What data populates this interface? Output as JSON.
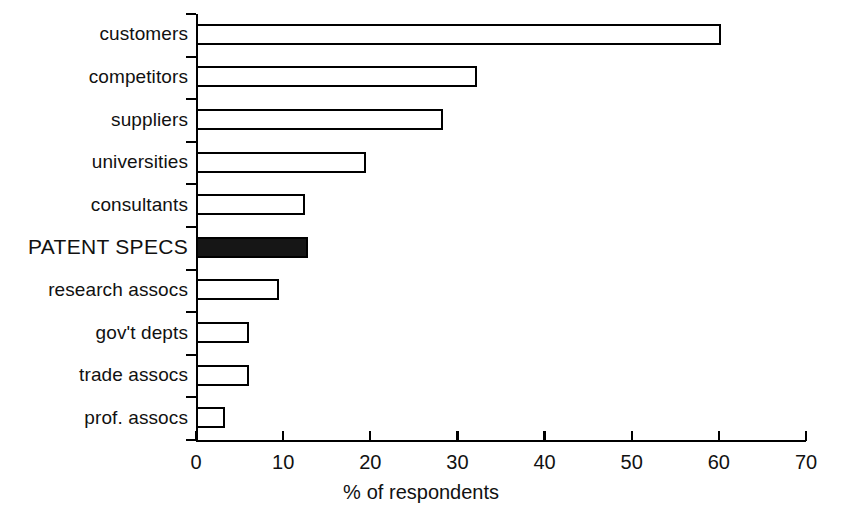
{
  "chart_data": {
    "type": "bar",
    "orientation": "horizontal",
    "title": "",
    "xlabel": "% of respondents",
    "ylabel": "",
    "xlim": [
      0,
      70
    ],
    "xticks": [
      0,
      10,
      20,
      30,
      40,
      50,
      60,
      70
    ],
    "xtick_labels": [
      "0",
      "10",
      "20",
      "30",
      "40",
      "50",
      "60",
      "70"
    ],
    "grid": false,
    "legend": null,
    "categories": [
      "customers",
      "competitors",
      "suppliers",
      "universities",
      "consultants",
      "PATENT SPECS",
      "research assocs",
      "gov't depts",
      "trade assocs",
      "prof. assocs"
    ],
    "values": [
      60.2,
      32.3,
      28.4,
      19.5,
      12.5,
      12.8,
      9.5,
      6.1,
      6.1,
      3.3
    ],
    "highlight_index": 5,
    "highlight_color": "#161616",
    "bar_fill_color": "#ffffff",
    "bar_edge_color": "#000000",
    "bars": [
      {
        "category": "customers",
        "value": 60.2,
        "highlighted": false
      },
      {
        "category": "competitors",
        "value": 32.3,
        "highlighted": false
      },
      {
        "category": "suppliers",
        "value": 28.4,
        "highlighted": false
      },
      {
        "category": "universities",
        "value": 19.5,
        "highlighted": false
      },
      {
        "category": "consultants",
        "value": 12.5,
        "highlighted": false
      },
      {
        "category": "PATENT SPECS",
        "value": 12.8,
        "highlighted": true
      },
      {
        "category": "research assocs",
        "value": 9.5,
        "highlighted": false
      },
      {
        "category": "gov't depts",
        "value": 6.1,
        "highlighted": false
      },
      {
        "category": "trade assocs",
        "value": 6.1,
        "highlighted": false
      },
      {
        "category": "prof. assocs",
        "value": 3.3,
        "highlighted": false
      }
    ]
  },
  "axis_title": {
    "percent_symbol": "%",
    "rest": "of respondents"
  }
}
